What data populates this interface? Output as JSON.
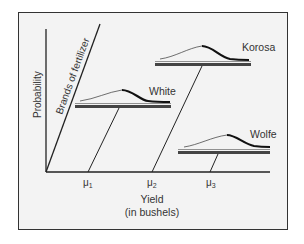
{
  "diagram": {
    "y_axis_label": "Probability",
    "x_axis_label_line1": "Yield",
    "x_axis_label_line2": "(in bushels)",
    "depth_axis_label": "Brands of fertilizer",
    "tick_labels": {
      "mu1": "μ1",
      "mu2": "μ2",
      "mu3": "μ3"
    },
    "mu_symbol": "μ",
    "mu_subscripts": [
      "1",
      "2",
      "3"
    ],
    "brands": [
      {
        "name": "White",
        "mean_label": "μ1"
      },
      {
        "name": "Korosa",
        "mean_label": "μ2"
      },
      {
        "name": "Wolfe",
        "mean_label": "μ3"
      }
    ],
    "colors": {
      "background": "#f3f3f3",
      "line": "#222222",
      "text": "#333333"
    }
  }
}
